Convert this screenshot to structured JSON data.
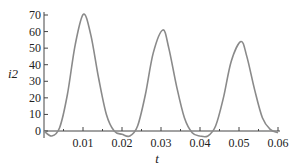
{
  "chart_data": {
    "type": "line",
    "title": "",
    "xlabel": "t",
    "ylabel": "i2",
    "xlim": [
      0,
      0.06
    ],
    "ylim": [
      -5,
      72
    ],
    "grid": false,
    "legend": null,
    "x_ticks": [
      "0.01",
      "0.02",
      "0.03",
      "0.04",
      "0.05",
      "0.06"
    ],
    "y_ticks": [
      "0",
      "10",
      "20",
      "30",
      "40",
      "50",
      "60",
      "70"
    ],
    "series": [
      {
        "name": "i2",
        "color": "#8a8a8a",
        "x": [
          0,
          0.002,
          0.004,
          0.006,
          0.008,
          0.0101,
          0.012,
          0.014,
          0.016,
          0.018,
          0.02,
          0.022,
          0.024,
          0.026,
          0.028,
          0.0305,
          0.032,
          0.034,
          0.036,
          0.038,
          0.04,
          0.042,
          0.044,
          0.046,
          0.048,
          0.0505,
          0.052,
          0.054,
          0.056,
          0.058,
          0.06
        ],
        "values": [
          0,
          -3,
          2,
          22,
          52,
          70.5,
          58,
          32,
          10,
          0,
          -2,
          -3,
          3,
          22,
          47,
          61,
          50,
          27,
          8,
          -1,
          -3,
          -3,
          3,
          20,
          42,
          54,
          45,
          25,
          8,
          1,
          -1
        ]
      }
    ]
  }
}
